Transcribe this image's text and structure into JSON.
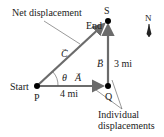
{
  "diagram": {
    "type": "vector-addition",
    "labels": {
      "net_displacement": "Net displacement",
      "end": "End",
      "start": "Start",
      "point_start": "P",
      "point_corner": "Q",
      "point_end": "S",
      "north": "N",
      "individual_line1": "Individual",
      "individual_line2": "displacements",
      "angle": "θ"
    },
    "vectors": {
      "A": {
        "symbol": "A",
        "magnitude_label": "4 mi",
        "direction": "east"
      },
      "B": {
        "symbol": "B",
        "magnitude_label": "3 mi",
        "direction": "north"
      },
      "C": {
        "symbol": "C",
        "magnitude_label": "",
        "direction": "northeast"
      }
    },
    "vector_arrow_glyph": "→",
    "colors": {
      "vector": "#6b6b6b",
      "point": "#000000",
      "leader_line": "#555555",
      "text": "#222222"
    }
  }
}
